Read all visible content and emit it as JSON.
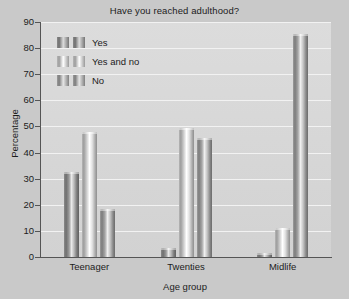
{
  "chart_data": {
    "type": "bar",
    "title": "Have you reached adulthood?",
    "xlabel": "Age group",
    "ylabel": "Percentage",
    "categories": [
      "Teenager",
      "Twenties",
      "Midlife"
    ],
    "series": [
      {
        "name": "Yes",
        "values": [
          32.5,
          3.5,
          1.5
        ]
      },
      {
        "name": "Yes and no",
        "values": [
          48.0,
          49.5,
          11.0
        ]
      },
      {
        "name": "No",
        "values": [
          18.5,
          45.5,
          85.5
        ]
      }
    ],
    "ylim": [
      0,
      90
    ],
    "yticks": [
      0,
      10,
      20,
      30,
      40,
      50,
      60,
      70,
      80,
      90
    ],
    "ytick_labels": [
      "0",
      "10",
      "20",
      "30",
      "40",
      "50",
      "60",
      "70",
      "80",
      "90"
    ],
    "grid": true,
    "legend_position": "top-left",
    "colors": {
      "background": "#c9c9c9",
      "plot_background": "#d8d8d8",
      "gridline": "#f2f2f2",
      "axis": "#555555",
      "text": "#1c1c1c",
      "series_yes": "#8a8a8a",
      "series_yes_and_no": "#d8d8d8",
      "series_no": "#9c9c9c"
    }
  }
}
